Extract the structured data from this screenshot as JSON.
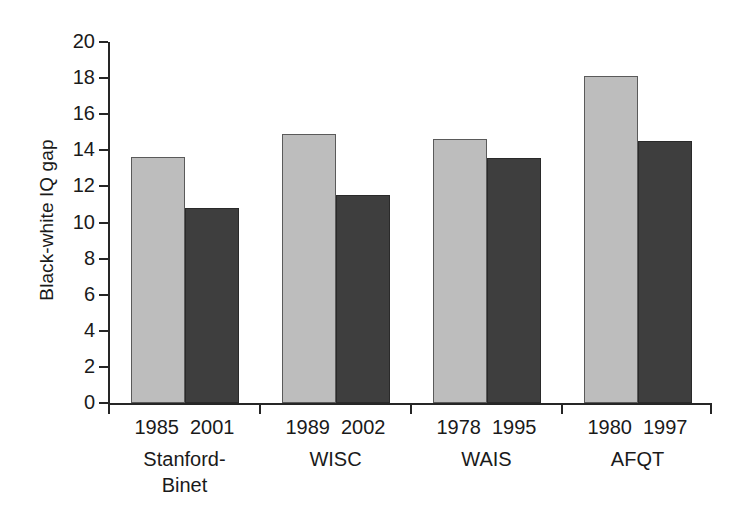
{
  "chart_data": {
    "type": "bar",
    "title": "",
    "subtitle": "",
    "xlabel": "",
    "ylabel": "Black-white IQ gap",
    "ylim": [
      0,
      20
    ],
    "ytick_labels": [
      "0",
      "2",
      "4",
      "6",
      "8",
      "10",
      "12",
      "14",
      "16",
      "18",
      "20"
    ],
    "ytick_values": [
      0,
      2,
      4,
      6,
      8,
      10,
      12,
      14,
      16,
      18,
      20
    ],
    "grid": false,
    "legend": "none",
    "categories": [
      "Stanford-Binet",
      "WISC",
      "WAIS",
      "AFQT"
    ],
    "series": [
      {
        "name": "Earlier test year",
        "color": "#bdbdbd",
        "years": [
          "1985",
          "1989",
          "1978",
          "1980"
        ],
        "values": [
          13.65,
          14.9,
          14.65,
          18.1
        ]
      },
      {
        "name": "Later test year",
        "color": "#3e3e3e",
        "years": [
          "2001",
          "2002",
          "1995",
          "1997"
        ],
        "values": [
          10.8,
          11.55,
          13.55,
          14.5
        ]
      }
    ],
    "groups": [
      {
        "name_line1": "Stanford-",
        "name_line2": "Binet",
        "year_earlier": "1985",
        "year_later": "2001",
        "value_earlier": 13.65,
        "value_later": 10.8
      },
      {
        "name_line1": "WISC",
        "name_line2": "",
        "year_earlier": "1989",
        "year_later": "2002",
        "value_earlier": 14.9,
        "value_later": 11.55
      },
      {
        "name_line1": "WAIS",
        "name_line2": "",
        "year_earlier": "1978",
        "year_later": "1995",
        "value_earlier": 14.65,
        "value_later": 13.55
      },
      {
        "name_line1": "AFQT",
        "name_line2": "",
        "year_earlier": "1980",
        "year_later": "1997",
        "value_earlier": 18.1,
        "value_later": 14.5
      }
    ]
  }
}
